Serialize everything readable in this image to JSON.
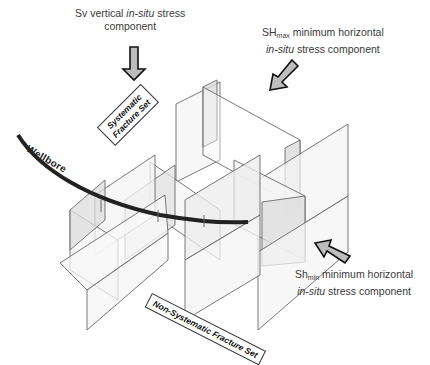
{
  "labels": {
    "sv": {
      "prefix": "Sv vertical ",
      "italic": "in-situ",
      "suffix": " stress",
      "line2": "component"
    },
    "shmax": {
      "main": "SH",
      "sub": "max",
      "rest": " minimum horizontal",
      "line2_italic": "in-situ",
      "line2_rest": " stress component"
    },
    "shmin": {
      "main": "Sh",
      "sub": "min",
      "rest": " minimum horizontal",
      "line2_italic": "in-situ",
      "line2_rest": " stress component"
    },
    "wellbore": "Wellbore",
    "systematic_line1": "Systematic",
    "systematic_line2": "Fracture Set",
    "non_systematic": "Non-Systematic Fracture Set"
  },
  "colors": {
    "plane_fill": "#f2f2f2",
    "plane_shade": "#dcdcdc",
    "plane_stroke": "#6a6a6a",
    "wellbore": "#222222",
    "arrow_fill": "#bdbdbd",
    "arrow_stroke": "#111111"
  }
}
